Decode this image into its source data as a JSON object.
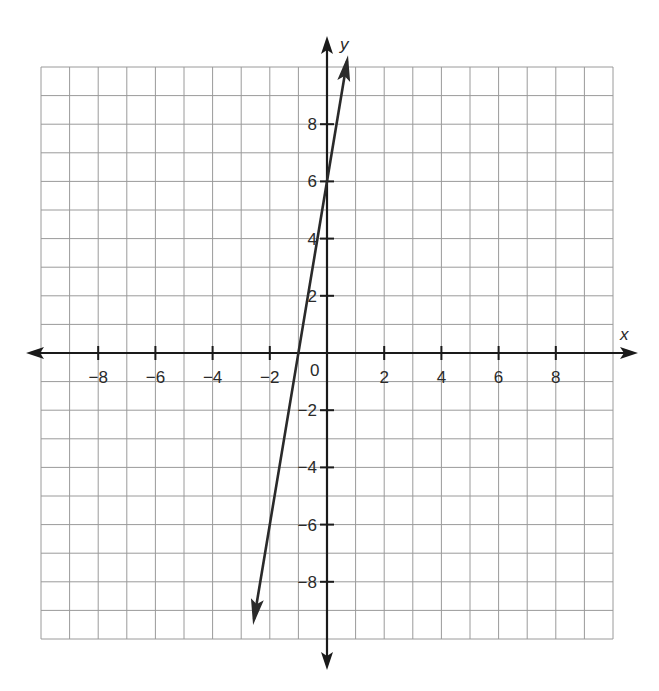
{
  "chart_data": {
    "type": "line",
    "title": "",
    "xlabel": "x",
    "ylabel": "y",
    "xlim": [
      -10,
      10
    ],
    "ylim": [
      -10,
      10
    ],
    "grid": true,
    "grid_step": 1,
    "x_tick_labels": [
      "-8",
      "-6",
      "-4",
      "-2",
      "2",
      "4",
      "6",
      "8"
    ],
    "y_tick_labels": [
      "8",
      "6",
      "4",
      "2",
      "-2",
      "-4",
      "-6",
      "-8"
    ],
    "origin_label": "0",
    "series": [
      {
        "name": "line",
        "equation": "y = 6x + 6",
        "slope": 6,
        "y_intercept": 6,
        "x_intercept": -1,
        "points": [
          [
            -2.55,
            -9.3
          ],
          [
            -1,
            0
          ],
          [
            0,
            6
          ],
          [
            0.7,
            10.2
          ]
        ],
        "arrows_both_ends": true
      }
    ]
  },
  "colors": {
    "grid": "#9a9a9a",
    "axis": "#1a1a1a",
    "line": "#2a2a2a"
  }
}
